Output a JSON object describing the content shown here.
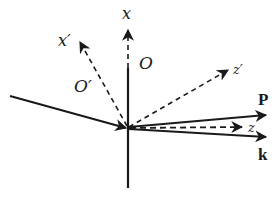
{
  "diagram": {
    "colors": {
      "stroke": "#1a1a1a",
      "background": "#ffffff"
    },
    "origin": {
      "x": 128,
      "y": 128
    },
    "labels": {
      "x_axis": "x",
      "x_prime_axis": "x′",
      "frame_O": "O",
      "frame_O_prime": "O′",
      "z_prime_axis": "z′",
      "z_axis": "z",
      "vector_P": "P",
      "vector_k": "k"
    },
    "elements": [
      {
        "name": "x-axis",
        "style": "solid+dashed",
        "from": [
          128,
          188
        ],
        "to": [
          128,
          30
        ],
        "arrow": true
      },
      {
        "name": "x-prime-axis",
        "style": "dashed",
        "from": [
          128,
          128
        ],
        "to": [
          80,
          42
        ],
        "arrow": true
      },
      {
        "name": "z-prime-axis",
        "style": "dashed",
        "from": [
          128,
          128
        ],
        "to": [
          228,
          70
        ],
        "arrow": true
      },
      {
        "name": "z-axis",
        "style": "dashed",
        "from": [
          128,
          128
        ],
        "to": [
          242,
          127
        ],
        "arrow": true
      },
      {
        "name": "vector-P",
        "style": "solid",
        "from": [
          128,
          128
        ],
        "to": [
          266,
          115
        ],
        "arrow": true
      },
      {
        "name": "vector-k",
        "style": "solid",
        "from": [
          128,
          128
        ],
        "to": [
          266,
          137
        ],
        "arrow": true
      },
      {
        "name": "incident-ray",
        "style": "solid",
        "from": [
          10,
          96
        ],
        "to": [
          126,
          128
        ],
        "arrow": true
      }
    ]
  }
}
